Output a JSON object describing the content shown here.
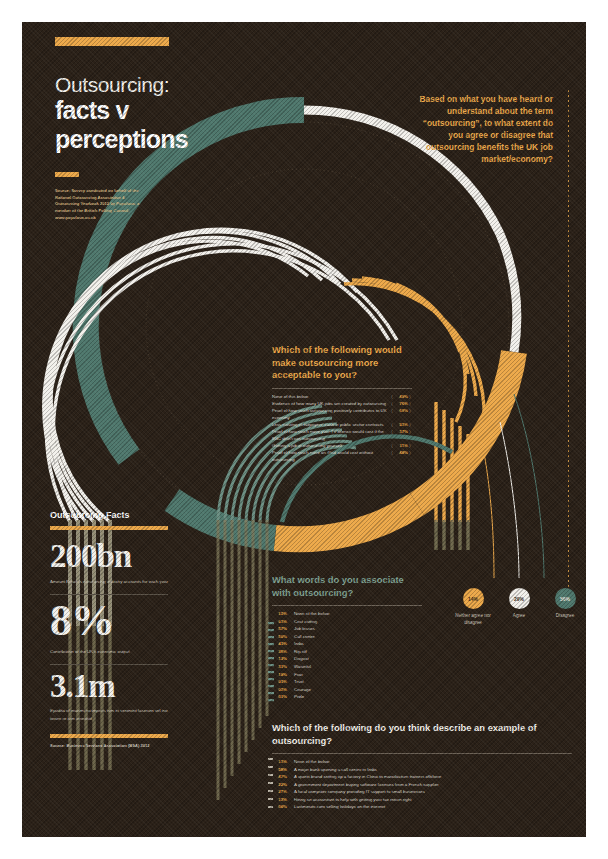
{
  "poster": {
    "title_line1": "Outsourcing:",
    "title_line2": "facts v",
    "title_line3": "perceptions",
    "source_top": "Source: Survey conducted on behalf of the National Outsourcing Association & Outsourcing Yearbook 2012 by Populous, a member of the British Polling Council, www.populous.co.uk",
    "question_right": "Based on what you have heard or understand about the term “outsourcing”, to what extent do you agree or disagree that outsourcing benefits the UK job market/economy?"
  },
  "colors": {
    "background": "#2b2118",
    "orange": "#eda94a",
    "teal": "#4f786d",
    "white": "#f3f1ec",
    "olive": "#7d7758"
  },
  "q1": {
    "heading": "Which of the following would make outsourcing more acceptable to you?",
    "rows": [
      {
        "label": "None of this below",
        "pct": "49%"
      },
      {
        "label": "Evidence of how many UK jobs are created by outsourcing",
        "pct": "76%"
      },
      {
        "label": "Proof of how much outsourcing positively contributes to UK economy",
        "pct": "69%"
      },
      {
        "label": "Less wasting of taxpayers' cash in public sector contracts",
        "pct": "53%"
      },
      {
        "label": "Proof of how much more your TV license would cost if the BBC didn't use outsourcing",
        "pct": "37%"
      },
      {
        "label": "Getting a job in outsourcing yourself",
        "pct": "11%"
      },
      {
        "label": "Proof of how much more an iPad would cost without outsourcing",
        "pct": "48%"
      }
    ]
  },
  "q2": {
    "heading": "What words do you associate with outsourcing?",
    "rows": [
      {
        "pct": "12%",
        "label": "None of the below"
      },
      {
        "pct": "63%",
        "label": "Cost cutting"
      },
      {
        "pct": "57%",
        "label": "Job losses"
      },
      {
        "pct": "56%",
        "label": "Call centre"
      },
      {
        "pct": "43%",
        "label": "India"
      },
      {
        "pct": "38%",
        "label": "Rip off"
      },
      {
        "pct": "13%",
        "label": "Disgust"
      },
      {
        "pct": "31%",
        "label": "Wasteful"
      },
      {
        "pct": "18%",
        "label": "Fear"
      },
      {
        "pct": "03%",
        "label": "Trust"
      },
      {
        "pct": "02%",
        "label": "Courage"
      },
      {
        "pct": "01%",
        "label": "Pride"
      }
    ]
  },
  "q3": {
    "heading": "Which of the following do you think describe an example of outsourcing?",
    "rows": [
      {
        "pct": "13%",
        "label": "None of the below"
      },
      {
        "pct": "58%",
        "label": "A major bank opening a call centre in India"
      },
      {
        "pct": "47%",
        "label": "A sports brand setting up a factory in China to manufacture trainers offshore"
      },
      {
        "pct": "22%",
        "label": "A government department buying software licenses from a French supplier"
      },
      {
        "pct": "27%",
        "label": "A local computer company providing IT support to small businesses"
      },
      {
        "pct": "13%",
        "label": "Hiring an accountant to help with getting your tax return right"
      },
      {
        "pct": "06%",
        "label": "Lastminute.com selling holidays on the internet"
      }
    ]
  },
  "facts": {
    "heading": "Outsourcing Facts",
    "items": [
      {
        "number": "200bn",
        "caption": "Amount Britain's outsourcing industry accounts for each year"
      },
      {
        "number": "8%",
        "caption": "Contribution to the UK's economic output"
      },
      {
        "number": "3.1m",
        "caption": "Epudita el maximi incimporis tem et venimint faserum vel ino torum re ium ionestiid"
      }
    ],
    "source": "Source: Business Services Association (BSA) 2012"
  },
  "chart_data": {
    "type": "pie",
    "title": "To what extent do you agree or disagree that outsourcing benefits the UK job market/economy?",
    "categories": [
      "Neither agree nor disagree",
      "Agree",
      "Disagree"
    ],
    "values": [
      14,
      29,
      56
    ],
    "labels": [
      "14%",
      "29%",
      "56%"
    ],
    "colors": [
      "#eda94a",
      "#f3f1ec",
      "#4f786d"
    ],
    "legend": "right"
  }
}
